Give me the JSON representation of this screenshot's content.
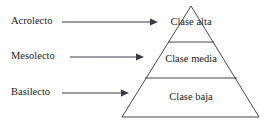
{
  "diagram": {
    "type": "pyramid",
    "title": "",
    "background_color": "#ffffff",
    "line_color": "#33333a",
    "text_color": "#1a1a1a",
    "tiers": [
      {
        "id": "top",
        "label": "Clase alta",
        "lect_label": "Acrolecto",
        "label_x": 191,
        "label_y": 23,
        "lect_x": 11,
        "lect_y": 22,
        "arrow_x1": 62,
        "arrow_x2": 158,
        "arrow_y": 22
      },
      {
        "id": "middle",
        "label": "Clase media",
        "lect_label": "Mesolecto",
        "label_x": 191,
        "label_y": 60,
        "lect_x": 11,
        "lect_y": 57,
        "arrow_x1": 70,
        "arrow_x2": 144,
        "arrow_y": 57
      },
      {
        "id": "bottom",
        "label": "Clase baja",
        "lect_label": "Basilecto",
        "label_x": 191,
        "label_y": 98,
        "lect_x": 11,
        "lect_y": 93,
        "arrow_x1": 62,
        "arrow_x2": 129,
        "arrow_y": 93
      }
    ],
    "geometry": {
      "apex_x": 191,
      "apex_y": 6,
      "base_left_x": 122,
      "base_right_x": 259,
      "base_y": 117,
      "divider_1_y": 42,
      "divider_1_x1": 168,
      "divider_1_x2": 214,
      "divider_2_y": 78,
      "divider_2_x1": 145,
      "divider_2_x2": 237
    }
  }
}
